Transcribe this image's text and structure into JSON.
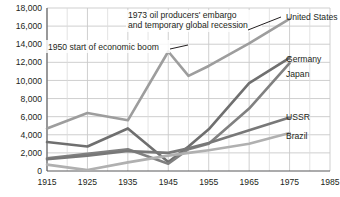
{
  "chart_data": {
    "type": "line",
    "title": "",
    "xlabel": "",
    "ylabel": "",
    "xlim": [
      1915,
      1985
    ],
    "ylim": [
      0,
      18000
    ],
    "grid": true,
    "legend_position": "right-inline-labels",
    "xticks": [
      "1915",
      "1925",
      "1935",
      "1945",
      "1955",
      "1965",
      "1975",
      "1985"
    ],
    "yticks": [
      "0",
      "2,000",
      "4,000",
      "6,000",
      "8,000",
      "10,000",
      "12,000",
      "14,000",
      "16,000",
      "18,000"
    ],
    "x": [
      1915,
      1925,
      1935,
      1945,
      1950,
      1955,
      1965,
      1975
    ],
    "series": [
      {
        "name": "United States",
        "color": "#9d9d9d",
        "values": [
          4700,
          6400,
          5600,
          13200,
          10500,
          11600,
          14100,
          16800
        ]
      },
      {
        "name": "Germany",
        "color": "#6f6f6f",
        "values": [
          3200,
          2700,
          4700,
          1000,
          2700,
          4600,
          9700,
          12500
        ]
      },
      {
        "name": "Japan",
        "color": "#808080",
        "values": [
          1400,
          1900,
          2400,
          800,
          2400,
          3000,
          6900,
          11900
        ]
      },
      {
        "name": "USSR",
        "color": "#787878",
        "values": [
          1300,
          1700,
          2200,
          2000,
          2500,
          3100,
          4500,
          5900
        ]
      },
      {
        "name": "Brazil",
        "color": "#b0b0b0",
        "values": [
          700,
          100,
          950,
          1700,
          2000,
          2300,
          3000,
          4200
        ]
      }
    ],
    "annotations": [
      {
        "id": "embargo",
        "lines": [
          "1973 oil producers' embargo",
          "and temporary global recession"
        ],
        "target_series": "United States",
        "target_x": 1973
      },
      {
        "id": "boom",
        "lines": [
          "1950 start of economic boom"
        ],
        "target_series": "United States",
        "target_x": 1950
      }
    ]
  },
  "colors": {
    "axis": "#58585a",
    "grid": "#c9c9c9",
    "text": "#231f20",
    "background": "#ffffff"
  }
}
